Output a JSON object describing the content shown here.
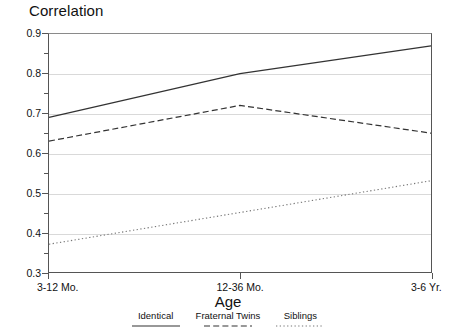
{
  "chart_data": {
    "type": "line",
    "title": "",
    "ylabel": "Correlation",
    "xlabel": "Age",
    "categories": [
      "3-12 Mo.",
      "12-36 Mo.",
      "3-6 Yr."
    ],
    "series": [
      {
        "name": "Identical",
        "style": "solid",
        "color": "#333333",
        "values": [
          0.69,
          0.8,
          0.87
        ]
      },
      {
        "name": "Fraternal Twins",
        "style": "dashed",
        "color": "#333333",
        "values": [
          0.63,
          0.72,
          0.65
        ]
      },
      {
        "name": "Siblings",
        "style": "dotted",
        "color": "#777777",
        "values": [
          0.37,
          0.45,
          0.53
        ]
      }
    ],
    "ylim": [
      0.3,
      0.9
    ],
    "yticks": [
      "0.9",
      "0.8",
      "0.7",
      "0.6",
      "0.5",
      "0.4",
      "0.3"
    ],
    "ytick_values": [
      0.9,
      0.8,
      0.7,
      0.6,
      0.5,
      0.4,
      0.3
    ],
    "grid": true,
    "legend_position": "bottom"
  },
  "axis": {
    "y_title": "Correlation",
    "x_title": "Age",
    "y_labels": [
      "0.9",
      "0.8",
      "0.7",
      "0.6",
      "0.5",
      "0.4",
      "0.3"
    ],
    "x_labels": [
      "3-12 Mo.",
      "12-36 Mo.",
      "3-6 Yr."
    ]
  },
  "legend": {
    "items": [
      {
        "label": "Identical"
      },
      {
        "label": "Fraternal Twins"
      },
      {
        "label": "Siblings"
      }
    ]
  }
}
